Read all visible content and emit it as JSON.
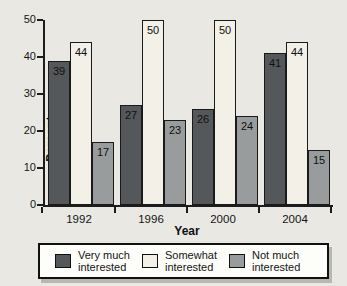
{
  "figure": {
    "background": "#e9e8e3",
    "axis_color": "#1c1c1c",
    "text_color": "#111111"
  },
  "chart_data": {
    "type": "bar",
    "title": "",
    "xlabel": "Year",
    "ylabel": "Percent",
    "ylim": [
      0,
      50
    ],
    "yticks": [
      0,
      10,
      20,
      30,
      40,
      50
    ],
    "categories": [
      "1992",
      "1996",
      "2000",
      "2004"
    ],
    "series": [
      {
        "name": "Very much interested",
        "color": "#54585b",
        "values": [
          39,
          27,
          26,
          41
        ]
      },
      {
        "name": "Somewhat interested",
        "color": "#f2f0e7",
        "values": [
          44,
          50,
          50,
          44
        ]
      },
      {
        "name": "Not much interested",
        "color": "#989c9c",
        "values": [
          17,
          23,
          24,
          15
        ]
      }
    ],
    "bar_value_labels": true,
    "grid": false,
    "legend_position": "bottom"
  }
}
